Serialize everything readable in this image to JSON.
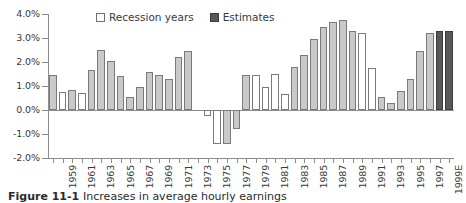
{
  "legend": {
    "items": [
      {
        "label": "Recession years",
        "swatch": "recession",
        "color": "#ffffff"
      },
      {
        "label": "Estimates",
        "swatch": "estimate",
        "color": "#585858"
      }
    ]
  },
  "caption": {
    "label": "Figure 11-1",
    "text": "Increases in average hourly earnings"
  },
  "chart_data": {
    "type": "bar",
    "title": "",
    "subtitle": "",
    "xlabel": "",
    "ylabel": "",
    "ylim": [
      -2.0,
      4.0
    ],
    "ytick_values": [
      4.0,
      3.0,
      2.0,
      1.0,
      0.0,
      -1.0,
      -2.0
    ],
    "ytick_labels": [
      "4.0%",
      "3.0%",
      "2.0%",
      "1.0%",
      "0.0%",
      "-1.0%",
      "-2.0%"
    ],
    "grid": false,
    "legend_position": "top-center",
    "units": "percent",
    "xlabel_rotation": -90,
    "xtick_label_interval": 2,
    "colors": {
      "normal": "#c9c9c9",
      "recession": "#ffffff",
      "estimate": "#585858",
      "bar_border": "#7a7a7a",
      "axis": "#8d8d8d",
      "text": "#3a3a3a"
    },
    "categories": [
      "1958",
      "1959",
      "1960",
      "1961",
      "1962",
      "1963",
      "1964",
      "1965",
      "1966",
      "1967",
      "1968",
      "1969",
      "1970",
      "1971",
      "1972",
      "1973",
      "1974",
      "1975",
      "1976",
      "1977",
      "1978",
      "1979",
      "1980",
      "1981",
      "1982",
      "1983",
      "1984",
      "1985",
      "1986",
      "1987",
      "1988",
      "1989",
      "1990",
      "1991",
      "1992",
      "1993",
      "1994",
      "1995",
      "1996",
      "1997",
      "1998",
      "1999E"
    ],
    "tick_labels": [
      "1959",
      "1961",
      "1963",
      "1965",
      "1967",
      "1969",
      "1971",
      "1973",
      "1975",
      "1977",
      "1979",
      "1981",
      "1983",
      "1985",
      "1987",
      "1989",
      "1991",
      "1993",
      "1995",
      "1997",
      "1999E"
    ],
    "series": [
      {
        "name": "Increase in average hourly earnings",
        "values": [
          1.45,
          0.75,
          0.85,
          0.7,
          1.65,
          2.5,
          2.05,
          1.4,
          0.55,
          0.95,
          1.6,
          1.45,
          1.3,
          2.2,
          2.45,
          0.0,
          -0.25,
          -1.4,
          -1.4,
          -0.8,
          1.45,
          1.45,
          0.95,
          1.5,
          0.65,
          1.8,
          2.3,
          2.95,
          3.45,
          3.65,
          3.75,
          3.3,
          3.2,
          1.75,
          0.55,
          0.3,
          0.8,
          1.3,
          2.45,
          3.2,
          3.3,
          3.3
        ],
        "types": [
          "normal",
          "recession",
          "normal",
          "recession",
          "normal",
          "normal",
          "normal",
          "normal",
          "normal",
          "normal",
          "normal",
          "normal",
          "normal",
          "normal",
          "normal",
          "normal",
          "recession",
          "recession",
          "normal",
          "normal",
          "normal",
          "recession",
          "recession",
          "recession",
          "recession",
          "normal",
          "normal",
          "normal",
          "normal",
          "normal",
          "normal",
          "normal",
          "recession",
          "recession",
          "normal",
          "normal",
          "normal",
          "normal",
          "normal",
          "normal",
          "estimate",
          "estimate"
        ]
      }
    ]
  }
}
